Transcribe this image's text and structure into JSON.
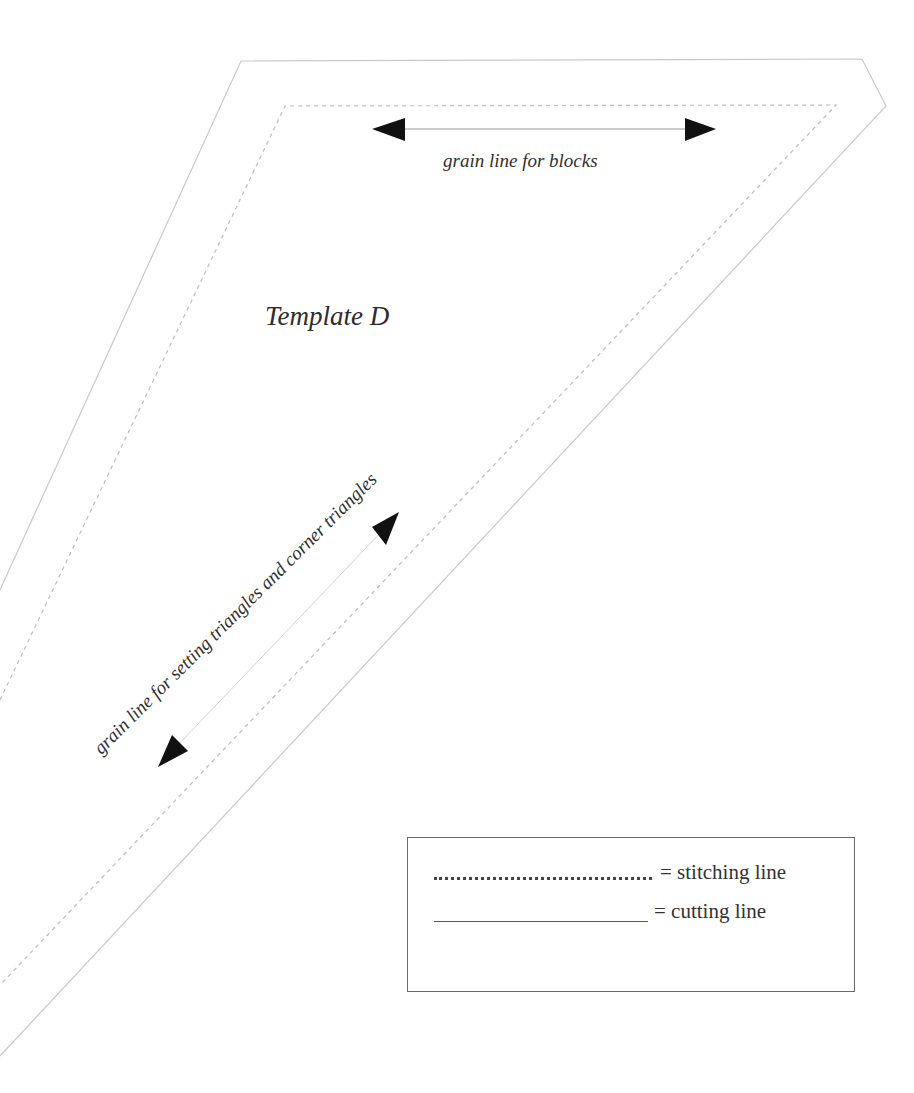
{
  "template": {
    "title": "Template D",
    "grain_line_blocks_label": "grain line for blocks",
    "grain_line_diagonal_label": "grain line for setting triangles and corner triangles"
  },
  "legend": {
    "stitching": {
      "symbol": "dotted-line",
      "label": "=  stitching line"
    },
    "cutting": {
      "symbol": "solid-line",
      "label": "= cutting line"
    }
  },
  "colors": {
    "cutting_line": "#c8c8c8",
    "stitching_line": "#bdbdbd",
    "arrow": "#111111",
    "grain_line": "#9a9a9a",
    "text": "#303030",
    "legend_border": "#6a6a6a"
  },
  "shape": {
    "cutting_outline": [
      [
        241,
        61
      ],
      [
        862,
        59
      ],
      [
        886,
        106
      ],
      [
        0,
        1056
      ],
      [
        0,
        590
      ]
    ],
    "stitching_outline": [
      [
        285,
        106
      ],
      [
        836,
        105
      ],
      [
        0,
        985
      ],
      [
        0,
        700
      ]
    ]
  },
  "grain_lines": {
    "horizontal": {
      "from": [
        372,
        129
      ],
      "to": [
        716,
        129
      ]
    },
    "diagonal": {
      "from": [
        158,
        767
      ],
      "to": [
        399,
        512
      ]
    }
  }
}
